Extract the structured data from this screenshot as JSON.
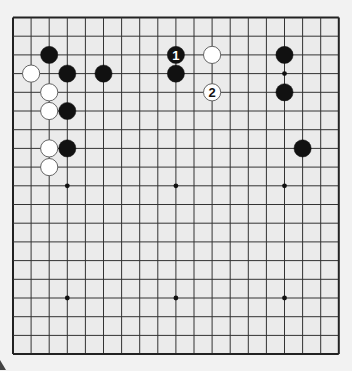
{
  "diagram": {
    "type": "go-board",
    "size": 19,
    "colors": {
      "background": "#f2f2f2",
      "board": "#ebebeb",
      "line": "#333333",
      "border": "#222222",
      "black_stone": "#111111",
      "white_stone": "#ffffff",
      "white_stone_edge": "#555555"
    },
    "geometry": {
      "origin_x": 13,
      "origin_y": 17.5,
      "step_x": 18.1,
      "step_y": 18.7,
      "stone_radius": 8.6
    },
    "star_points": [
      [
        3,
        3
      ],
      [
        9,
        3
      ],
      [
        15,
        3
      ],
      [
        3,
        9
      ],
      [
        9,
        9
      ],
      [
        15,
        9
      ],
      [
        3,
        15
      ],
      [
        9,
        15
      ],
      [
        15,
        15
      ]
    ],
    "stones": [
      {
        "color": "black",
        "col": 2,
        "row": 2,
        "label": ""
      },
      {
        "color": "white",
        "col": 1,
        "row": 3,
        "label": ""
      },
      {
        "color": "black",
        "col": 3,
        "row": 3,
        "label": ""
      },
      {
        "color": "black",
        "col": 5,
        "row": 3,
        "label": ""
      },
      {
        "color": "white",
        "col": 2,
        "row": 4,
        "label": ""
      },
      {
        "color": "white",
        "col": 2,
        "row": 5,
        "label": ""
      },
      {
        "color": "black",
        "col": 3,
        "row": 5,
        "label": ""
      },
      {
        "color": "white",
        "col": 2,
        "row": 7,
        "label": ""
      },
      {
        "color": "black",
        "col": 3,
        "row": 7,
        "label": ""
      },
      {
        "color": "white",
        "col": 2,
        "row": 8,
        "label": ""
      },
      {
        "color": "black",
        "col": 9,
        "row": 2,
        "label": "1"
      },
      {
        "color": "black",
        "col": 9,
        "row": 3,
        "label": ""
      },
      {
        "color": "white",
        "col": 11,
        "row": 2,
        "label": ""
      },
      {
        "color": "white",
        "col": 11,
        "row": 4,
        "label": "2"
      },
      {
        "color": "black",
        "col": 15,
        "row": 2,
        "label": ""
      },
      {
        "color": "black",
        "col": 15,
        "row": 4,
        "label": ""
      },
      {
        "color": "black",
        "col": 16,
        "row": 7,
        "label": ""
      }
    ]
  }
}
